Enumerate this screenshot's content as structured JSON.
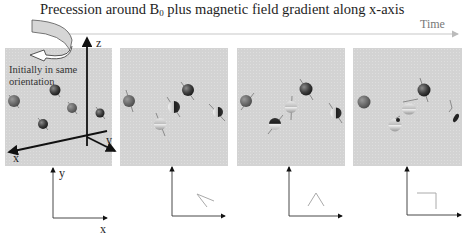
{
  "title": {
    "prefix": "Precession around B",
    "subscript": "0",
    "suffix": " plus magnetic field gradient along x-axis"
  },
  "time_axis": {
    "label": "Time",
    "color": "#bbbbbb"
  },
  "annotation": {
    "line1": "Initially in same",
    "line2": "orientation"
  },
  "axes_3d": {
    "z_label": "z",
    "x_label": "x",
    "y_label": "y"
  },
  "axes_2d": {
    "y_label": "y",
    "x_label": "x"
  },
  "panels": [
    {
      "index": 1,
      "description": "All spins in same orientation",
      "projection": "none"
    },
    {
      "index": 2,
      "description": "Spins begin to dephase along x",
      "projection": "fan of two short lines"
    },
    {
      "index": 3,
      "description": "Further dephasing",
      "projection": "inverted V"
    },
    {
      "index": 4,
      "description": "Larger dephasing",
      "projection": "right angle"
    }
  ],
  "colors": {
    "panel_bg": "#d3d3d3",
    "axis": "#111111",
    "light_axis": "#666666",
    "projection_line": "#aaaaaa",
    "sphere_dark": "#3a3a3a"
  }
}
